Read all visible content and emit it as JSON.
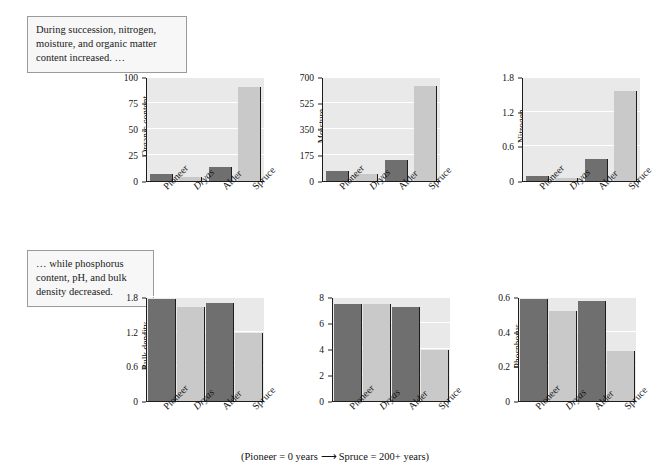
{
  "notes": {
    "top": "During succession, nitrogen, moisture, and organic matter content increased. …",
    "bottom": "… while phosphorus content, pH, and bulk density decreased."
  },
  "caption": {
    "left": "(Pioneer = 0 years",
    "arrow": "⟶",
    "right": "Spruce = 200+ years)"
  },
  "categories": [
    "Pioneer",
    "Dryas",
    "Alder",
    "Spruce"
  ],
  "colors": {
    "bar_dark": "#6f6f6f",
    "bar_light": "#c9c9c9",
    "plot_background": "#e9e9e9",
    "gridline": "#ffffff",
    "axis": "#1d1d1d",
    "note_border": "#9a9a9a",
    "note_background": "#f7f7f7"
  },
  "chart_data": [
    {
      "type": "bar",
      "id": "organic-content",
      "title": "",
      "ylabel": "Organic content",
      "yunit": "(mg/g)",
      "xlabel": "",
      "categories": [
        "Pioneer",
        "Dryas",
        "Alder",
        "Spruce"
      ],
      "values": [
        7,
        4,
        13,
        90
      ],
      "ticks": [
        "0",
        "25",
        "50",
        "75",
        "100"
      ],
      "ylim": [
        0,
        100
      ],
      "grid": true,
      "legend": "none"
    },
    {
      "type": "bar",
      "id": "moisture",
      "title": "",
      "ylabel": "Moisture",
      "yunit": "(mg/g)",
      "xlabel": "",
      "categories": [
        "Pioneer",
        "Dryas",
        "Alder",
        "Spruce"
      ],
      "values": [
        70,
        45,
        140,
        640
      ],
      "ticks": [
        "0",
        "175",
        "350",
        "525",
        "700"
      ],
      "ylim": [
        0,
        700
      ],
      "grid": true,
      "legend": "none"
    },
    {
      "type": "bar",
      "id": "nitrogen",
      "title": "",
      "ylabel": "Nitrogen",
      "yunit": "(mg/g)",
      "xlabel": "",
      "categories": [
        "Pioneer",
        "Dryas",
        "Alder",
        "Spruce"
      ],
      "values": [
        0.08,
        0.05,
        0.38,
        1.55
      ],
      "ticks": [
        "0",
        "0.6",
        "1.2",
        "1.8"
      ],
      "ylim": [
        0,
        1.8
      ],
      "grid": true,
      "legend": "none"
    },
    {
      "type": "bar",
      "id": "bulk-density",
      "title": "",
      "ylabel": "Bulk density",
      "yunit": "(g/cm³)",
      "xlabel": "",
      "categories": [
        "Pioneer",
        "Dryas",
        "Alder",
        "Spruce"
      ],
      "values": [
        1.77,
        1.62,
        1.7,
        1.17
      ],
      "ticks": [
        "0",
        "0.6",
        "1.2",
        "1.8"
      ],
      "ylim": [
        0,
        1.8
      ],
      "grid": true,
      "legend": "none"
    },
    {
      "type": "bar",
      "id": "ph",
      "title": "",
      "ylabel": "pH",
      "yunit": "",
      "xlabel": "",
      "categories": [
        "Pioneer",
        "Dryas",
        "Alder",
        "Spruce"
      ],
      "values": [
        7.5,
        7.5,
        7.2,
        3.9
      ],
      "ticks": [
        "0",
        "2",
        "4",
        "6",
        "8"
      ],
      "ylim": [
        0,
        8
      ],
      "grid": true,
      "legend": "none"
    },
    {
      "type": "bar",
      "id": "phosphorus",
      "title": "",
      "ylabel": "Phosphorus",
      "yunit": "(mg/g)",
      "xlabel": "",
      "categories": [
        "Pioneer",
        "Dryas",
        "Alder",
        "Spruce"
      ],
      "values": [
        0.59,
        0.52,
        0.575,
        0.29
      ],
      "ticks": [
        "0",
        "0.2",
        "0.4",
        "0.6"
      ],
      "ylim": [
        0,
        0.6
      ],
      "grid": true,
      "legend": "none"
    }
  ]
}
